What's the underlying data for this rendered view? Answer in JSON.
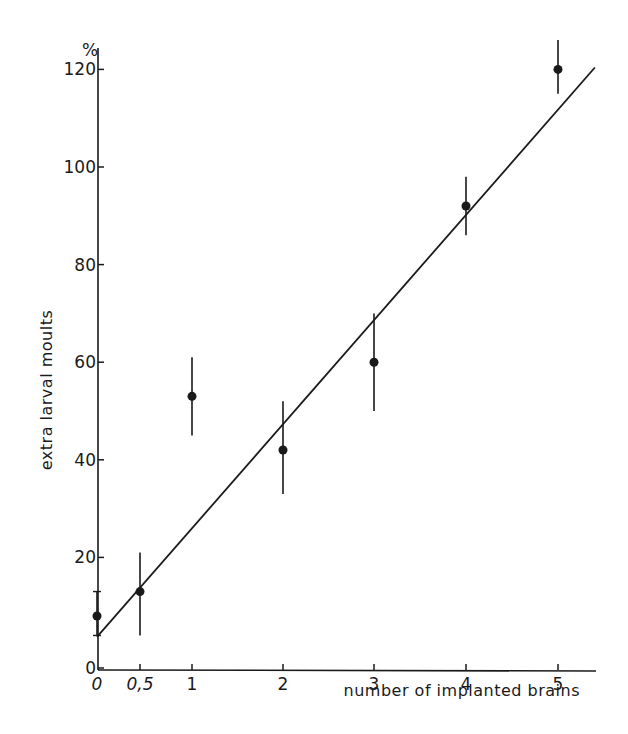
{
  "chart_data": {
    "type": "scatter",
    "title": "",
    "xlabel": "number of implanted brains",
    "ylabel": "extra larval moults",
    "y_unit": "%",
    "x_ticks": [
      "0",
      "0,5",
      "1",
      "2",
      "3",
      "4",
      "5"
    ],
    "x_tick_values": [
      0,
      0.5,
      1,
      2,
      3,
      4,
      5
    ],
    "y_ticks": [
      "0",
      "20",
      "40",
      "60",
      "80",
      "100",
      "120"
    ],
    "y_tick_values": [
      0,
      20,
      40,
      60,
      80,
      100,
      120
    ],
    "xlim": [
      0,
      5.4
    ],
    "ylim": [
      0,
      125
    ],
    "grid": false,
    "legend": null,
    "series": [
      {
        "name": "extra larval moults",
        "points": [
          {
            "x": 0,
            "y": 8,
            "err_low": 4,
            "err_high": 13
          },
          {
            "x": 0.5,
            "y": 13,
            "err_low": 4,
            "err_high": 21
          },
          {
            "x": 1,
            "y": 53,
            "err_low": 45,
            "err_high": 61
          },
          {
            "x": 2,
            "y": 42,
            "err_low": 33,
            "err_high": 52
          },
          {
            "x": 3,
            "y": 60,
            "err_low": 50,
            "err_high": 70
          },
          {
            "x": 4,
            "y": 92,
            "err_low": 86,
            "err_high": 98
          },
          {
            "x": 5,
            "y": 120,
            "err_low": 115,
            "err_high": 126
          }
        ]
      }
    ],
    "regression_line": {
      "x0": 0,
      "y0": 3.5,
      "x1": 5.4,
      "y1": 121
    }
  }
}
